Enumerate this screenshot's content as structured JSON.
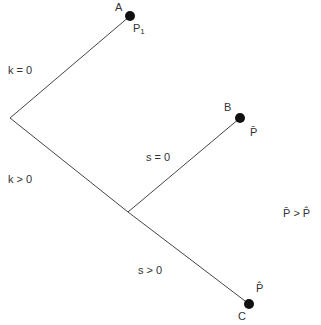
{
  "diagram": {
    "type": "decision-tree",
    "nodes": [
      {
        "id": "A",
        "label": "A",
        "payoff": "P",
        "payoff_sub": "1"
      },
      {
        "id": "B",
        "label": "B",
        "payoff": "P̄"
      },
      {
        "id": "C",
        "label": "C",
        "payoff": "P̂"
      }
    ],
    "branches": {
      "k_zero": "k = 0",
      "k_positive": "k > 0",
      "s_zero": "s = 0",
      "s_positive": "s > 0"
    },
    "condition": "P̄ > P̂"
  }
}
